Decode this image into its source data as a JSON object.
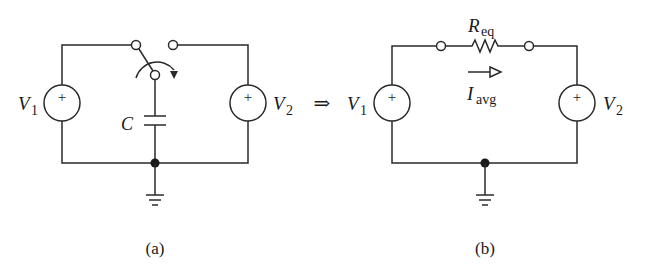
{
  "figure": {
    "arrow_symbol": "⇒",
    "circuit_a": {
      "caption": "(a)",
      "source_left": {
        "label": "V",
        "subscript": "1",
        "polarity": "+"
      },
      "source_right": {
        "label": "V",
        "subscript": "2",
        "polarity": "+"
      },
      "capacitor": {
        "label": "C"
      }
    },
    "circuit_b": {
      "caption": "(b)",
      "source_left": {
        "label": "V",
        "subscript": "1",
        "polarity": "+"
      },
      "source_right": {
        "label": "V",
        "subscript": "2",
        "polarity": "+"
      },
      "resistor": {
        "label": "R",
        "subscript": "eq"
      },
      "current": {
        "label": "I",
        "subscript": "avg"
      }
    }
  }
}
